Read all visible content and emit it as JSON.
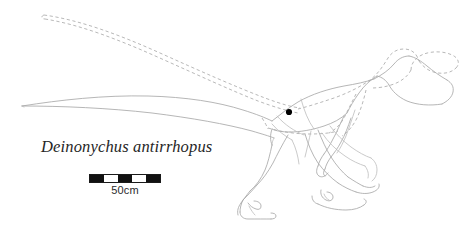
{
  "figure": {
    "kind": "scientific-scale-diagram",
    "subject": "Deinonychus antirrhopus",
    "background_color": "#ffffff"
  },
  "species_label": {
    "text": "Deinonychus antirrhopus",
    "style": "italic",
    "color": "#262626"
  },
  "scale_bar": {
    "caption": "50cm",
    "segments": [
      "dark",
      "light",
      "dark",
      "light",
      "dark"
    ],
    "segment_count": 5,
    "bar_color": "#111111",
    "outline_color": "#1a1a1a"
  },
  "markers": {
    "hip_dot_label": "hip-joint-marker",
    "hip_dot_color": "#000000"
  },
  "linework": {
    "skeleton_outline_color": "#a9a9a9",
    "feather_outline_color": "#b0b0b0",
    "feather_outline_style": "dashed",
    "skeleton_outline_style": "solid"
  },
  "parts": {
    "tail_solid": "skeletal-tail-outline",
    "tail_feathered": "feathered-tail-outline",
    "torso": "torso-outline",
    "neck": "neck-outline",
    "head": "head-outline",
    "arm": "forelimb-outline",
    "near_leg": "near-hindlimb-outline",
    "far_leg": "far-hindlimb-outline",
    "near_foot": "near-foot-with-sickle-claw",
    "far_foot": "far-foot-with-sickle-claw"
  }
}
